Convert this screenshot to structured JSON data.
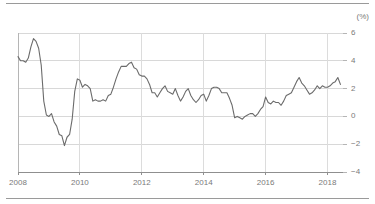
{
  "figure": {
    "unit_label": "(%)",
    "top_rule": true,
    "bottom_rule": true
  },
  "chart_data": {
    "type": "line",
    "title": "",
    "subtitle": "",
    "xlabel": "",
    "ylabel": "",
    "unit": "(%)",
    "xlim": [
      2008.0,
      2018.5
    ],
    "ylim": [
      -4,
      6
    ],
    "yticks": [
      6,
      4,
      2,
      0,
      -2,
      -4
    ],
    "ytick_labels": [
      "6",
      "4",
      "2",
      "0",
      "-2",
      "-4"
    ],
    "xticks": [
      2008,
      2010,
      2012,
      2014,
      2016,
      2018
    ],
    "xtick_labels": [
      "2008",
      "2010",
      "2012",
      "2014",
      "2016",
      "2018"
    ],
    "grid": "both-faint",
    "legend": "none",
    "line_color": "#6b6b6b",
    "line_width": 1.1,
    "series": [
      {
        "name": "Inflation Rate",
        "x": [
          2008.0,
          2008.083,
          2008.167,
          2008.25,
          2008.333,
          2008.417,
          2008.5,
          2008.583,
          2008.667,
          2008.75,
          2008.833,
          2008.917,
          2009.0,
          2009.083,
          2009.167,
          2009.25,
          2009.333,
          2009.417,
          2009.5,
          2009.583,
          2009.667,
          2009.75,
          2009.833,
          2009.917,
          2010.0,
          2010.083,
          2010.167,
          2010.25,
          2010.333,
          2010.417,
          2010.5,
          2010.583,
          2010.667,
          2010.75,
          2010.833,
          2010.917,
          2011.0,
          2011.083,
          2011.167,
          2011.25,
          2011.333,
          2011.417,
          2011.5,
          2011.583,
          2011.667,
          2011.75,
          2011.833,
          2011.917,
          2012.0,
          2012.083,
          2012.167,
          2012.25,
          2012.333,
          2012.417,
          2012.5,
          2012.583,
          2012.667,
          2012.75,
          2012.833,
          2012.917,
          2013.0,
          2013.083,
          2013.167,
          2013.25,
          2013.333,
          2013.417,
          2013.5,
          2013.583,
          2013.667,
          2013.75,
          2013.833,
          2013.917,
          2014.0,
          2014.083,
          2014.167,
          2014.25,
          2014.333,
          2014.417,
          2014.5,
          2014.583,
          2014.667,
          2014.75,
          2014.833,
          2014.917,
          2015.0,
          2015.083,
          2015.167,
          2015.25,
          2015.333,
          2015.417,
          2015.5,
          2015.583,
          2015.667,
          2015.75,
          2015.833,
          2015.917,
          2016.0,
          2016.083,
          2016.167,
          2016.25,
          2016.333,
          2016.417,
          2016.5,
          2016.583,
          2016.667,
          2016.75,
          2016.833,
          2016.917,
          2017.0,
          2017.083,
          2017.167,
          2017.25,
          2017.333,
          2017.417,
          2017.5,
          2017.583,
          2017.667,
          2017.75,
          2017.833,
          2017.917,
          2018.0,
          2018.083,
          2018.167,
          2018.25,
          2018.333,
          2018.417
        ],
        "values": [
          4.3,
          4.0,
          4.0,
          3.9,
          4.2,
          5.0,
          5.6,
          5.4,
          4.9,
          3.7,
          1.1,
          0.1,
          0.0,
          0.2,
          -0.4,
          -0.7,
          -1.3,
          -1.4,
          -2.1,
          -1.5,
          -1.3,
          -0.2,
          1.8,
          2.7,
          2.6,
          2.1,
          2.3,
          2.2,
          2.0,
          1.1,
          1.2,
          1.1,
          1.1,
          1.2,
          1.1,
          1.5,
          1.6,
          2.1,
          2.7,
          3.2,
          3.6,
          3.6,
          3.6,
          3.8,
          3.9,
          3.5,
          3.4,
          3.0,
          2.9,
          2.9,
          2.7,
          2.3,
          1.7,
          1.7,
          1.4,
          1.7,
          2.0,
          2.2,
          1.8,
          1.7,
          1.6,
          2.0,
          1.5,
          1.1,
          1.4,
          1.8,
          2.0,
          1.5,
          1.2,
          1.0,
          1.2,
          1.5,
          1.6,
          1.1,
          1.5,
          2.0,
          2.1,
          2.1,
          2.0,
          1.7,
          1.7,
          1.7,
          1.3,
          0.8,
          -0.1,
          0.0,
          -0.1,
          -0.2,
          0.0,
          0.1,
          0.2,
          0.2,
          0.0,
          0.2,
          0.5,
          0.7,
          1.4,
          1.0,
          0.9,
          1.1,
          1.0,
          1.0,
          0.8,
          1.1,
          1.5,
          1.6,
          1.7,
          2.1,
          2.5,
          2.8,
          2.4,
          2.2,
          1.9,
          1.6,
          1.7,
          1.9,
          2.2,
          2.0,
          2.2,
          2.1,
          2.1,
          2.2,
          2.4,
          2.5,
          2.8,
          2.3
        ]
      }
    ]
  }
}
